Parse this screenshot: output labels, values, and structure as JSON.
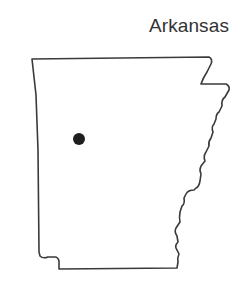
{
  "map": {
    "title": "Arkansas",
    "state": "Arkansas",
    "outline_color": "#3a3a3a",
    "marker": {
      "type": "location-dot",
      "color": "#1e1e1e",
      "position_px": [
        79,
        139
      ]
    }
  }
}
